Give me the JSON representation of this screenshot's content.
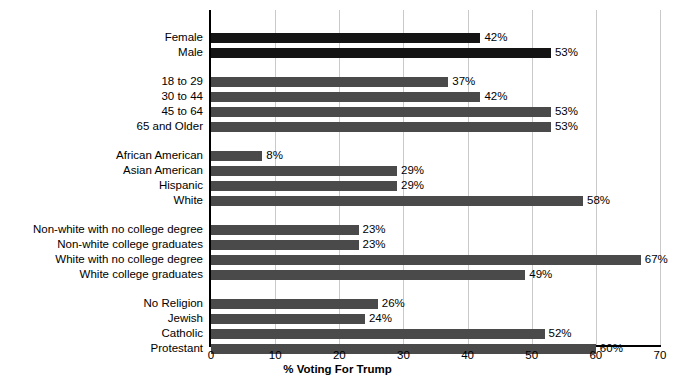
{
  "chart_data": {
    "type": "bar",
    "orientation": "horizontal",
    "title": "",
    "xlabel": "% Voting For Trump",
    "ylabel": "",
    "xlim": [
      0,
      70
    ],
    "xticks": [
      0,
      10,
      20,
      30,
      40,
      50,
      60,
      70
    ],
    "grid": true,
    "legend": false,
    "value_suffix": "%",
    "categories": [
      "Female",
      "Male",
      "18 to 29",
      "30 to 44",
      "45 to 64",
      "65 and Older",
      "African American",
      "Asian American",
      "Hispanic",
      "White",
      "Non-white with no college degree",
      "Non-white college graduates",
      "White with no college degree",
      "White college graduates",
      "No Religion",
      "Jewish",
      "Catholic",
      "Protestant"
    ],
    "values": [
      42,
      53,
      37,
      42,
      53,
      53,
      8,
      29,
      29,
      58,
      23,
      23,
      67,
      49,
      26,
      24,
      52,
      60
    ],
    "labels": [
      "42%",
      "53%",
      "37%",
      "42%",
      "53%",
      "53%",
      "8%",
      "29%",
      "29%",
      "58%",
      "23%",
      "23%",
      "67%",
      "49%",
      "26%",
      "24%",
      "52%",
      "60%"
    ],
    "groups": [
      {
        "name": "gender",
        "categories": [
          "Female",
          "Male"
        ],
        "color": "#141414"
      },
      {
        "name": "age",
        "categories": [
          "18 to 29",
          "30 to 44",
          "45 to 64",
          "65 and Older"
        ],
        "color": "#4a4a4a"
      },
      {
        "name": "race",
        "categories": [
          "African American",
          "Asian American",
          "Hispanic",
          "White"
        ],
        "color": "#4a4a4a"
      },
      {
        "name": "education",
        "categories": [
          "Non-white with no college degree",
          "Non-white college graduates",
          "White with no college degree",
          "White college graduates"
        ],
        "color": "#4a4a4a"
      },
      {
        "name": "religion",
        "categories": [
          "No Religion",
          "Jewish",
          "Catholic",
          "Protestant"
        ],
        "color": "#4a4a4a"
      }
    ],
    "colors": {
      "bar_dark": "#141414",
      "bar_gray": "#4a4a4a",
      "gridline": "#c9c9c9",
      "axis": "#000000",
      "background": "#ffffff"
    }
  },
  "rows": [
    {
      "label": "Female",
      "value": 42,
      "text": "42%",
      "dark": true,
      "top": 33
    },
    {
      "label": "Male",
      "value": 53,
      "text": "53%",
      "dark": true,
      "top": 48
    },
    {
      "label": "18 to 29",
      "value": 37,
      "text": "37%",
      "dark": false,
      "top": 77
    },
    {
      "label": "30 to 44",
      "value": 42,
      "text": "42%",
      "dark": false,
      "top": 92
    },
    {
      "label": "45 to 64",
      "value": 53,
      "text": "53%",
      "dark": false,
      "top": 107
    },
    {
      "label": "65 and Older",
      "value": 53,
      "text": "53%",
      "dark": false,
      "top": 122
    },
    {
      "label": "African American",
      "value": 8,
      "text": "8%",
      "dark": false,
      "top": 151
    },
    {
      "label": "Asian American",
      "value": 29,
      "text": "29%",
      "dark": false,
      "top": 166
    },
    {
      "label": "Hispanic",
      "value": 29,
      "text": "29%",
      "dark": false,
      "top": 181
    },
    {
      "label": "White",
      "value": 58,
      "text": "58%",
      "dark": false,
      "top": 196
    },
    {
      "label": "Non-white with no college degree",
      "value": 23,
      "text": "23%",
      "dark": false,
      "top": 225
    },
    {
      "label": "Non-white college graduates",
      "value": 23,
      "text": "23%",
      "dark": false,
      "top": 240
    },
    {
      "label": "White with no college degree",
      "value": 67,
      "text": "67%",
      "dark": false,
      "top": 255
    },
    {
      "label": "White college graduates",
      "value": 49,
      "text": "49%",
      "dark": false,
      "top": 270
    },
    {
      "label": "No Religion",
      "value": 26,
      "text": "26%",
      "dark": false,
      "top": 299
    },
    {
      "label": "Jewish",
      "value": 24,
      "text": "24%",
      "dark": false,
      "top": 314
    },
    {
      "label": "Catholic",
      "value": 52,
      "text": "52%",
      "dark": false,
      "top": 329
    },
    {
      "label": "Protestant",
      "value": 60,
      "text": "60%",
      "dark": false,
      "top": 344
    }
  ],
  "axis": {
    "ticks": [
      "0",
      "10",
      "20",
      "30",
      "40",
      "50",
      "60",
      "70"
    ],
    "tick_values": [
      0,
      10,
      20,
      30,
      40,
      50,
      60,
      70
    ],
    "title": "% Voting For Trump"
  }
}
